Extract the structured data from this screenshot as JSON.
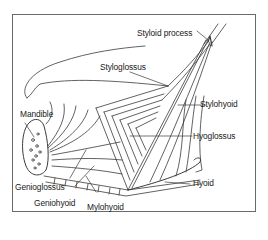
{
  "diagram": {
    "labels": {
      "styloid_process": "Styloid process",
      "styloglossus": "Styloglossus",
      "stylohyoid": "Stylohyoid",
      "mandible": "Mandible",
      "hyoglossus": "Hyoglossus",
      "hyoid": "Hyoid",
      "genioglossus": "Genioglossus",
      "geniohyoid": "Geniohyoid",
      "mylohyoid": "Mylohyoid"
    },
    "colors": {
      "line": "#3a3a3a",
      "frame": "#6a6a6a",
      "background": "#ffffff"
    }
  }
}
